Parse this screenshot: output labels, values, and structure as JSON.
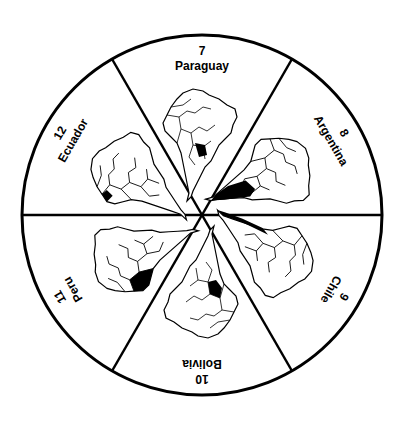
{
  "diagram": {
    "center": [
      202,
      215
    ],
    "radius": 180,
    "colors": {
      "stroke": "#000000",
      "fill": "#ffffff",
      "highlight": "#000000"
    },
    "segments": [
      {
        "number": "7",
        "country": "Paraguay",
        "angle": 0
      },
      {
        "number": "8",
        "country": "Argentina",
        "angle": 60
      },
      {
        "number": "9",
        "country": "Chile",
        "angle": 120
      },
      {
        "number": "10",
        "country": "Bolivia",
        "angle": 180
      },
      {
        "number": "11",
        "country": "Peru",
        "angle": 240
      },
      {
        "number": "12",
        "country": "Ecuador",
        "angle": 300
      }
    ]
  }
}
